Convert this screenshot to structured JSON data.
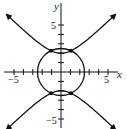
{
  "chart_data": {
    "type": "line",
    "title": "",
    "xlabel": "x",
    "ylabel": "y",
    "xlim": [
      -6.3,
      6.5
    ],
    "ylim": [
      -6,
      7.5
    ],
    "x_tick_labels": [
      "-5",
      "5"
    ],
    "y_tick_labels": [
      "5",
      "-5"
    ],
    "x_ticks": [
      -5,
      -4,
      -3,
      -2,
      -1,
      1,
      2,
      3,
      4,
      5
    ],
    "y_ticks": [
      -5,
      -4,
      -3,
      -2,
      -1,
      1,
      2,
      3,
      4,
      5
    ],
    "grid": false,
    "series": [
      {
        "name": "circle",
        "equation": "x^2 + y^2 = 6.25",
        "radius": 2.5
      },
      {
        "name": "hyperbola",
        "equation": "y^2 - x^2 = 4",
        "branches": "upper and lower, with arrows"
      }
    ],
    "intersection_points": [
      [
        -1.06,
        2.26
      ],
      [
        1.06,
        2.26
      ],
      [
        -1.06,
        -2.26
      ],
      [
        1.06,
        -2.26
      ]
    ]
  },
  "labels": {
    "x_axis": "x",
    "y_axis": "y",
    "x_neg": "−5",
    "x_pos": "5",
    "y_pos": "5",
    "y_neg": "−5"
  }
}
